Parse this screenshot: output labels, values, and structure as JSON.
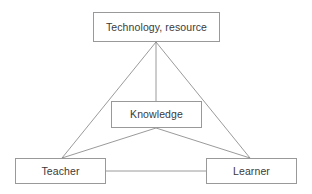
{
  "diagram": {
    "background_color": "#ffffff",
    "node_border_color": "#999999",
    "node_fill_color": "#ffffff",
    "edge_color": "#808080",
    "label_color": "#3a3a3a",
    "nodes": [
      {
        "id": "technology",
        "label": "Technology, resource",
        "x": 93,
        "y": 12,
        "width": 127,
        "height": 30
      },
      {
        "id": "knowledge",
        "label": "Knowledge",
        "x": 111,
        "y": 101,
        "width": 91,
        "height": 27
      },
      {
        "id": "teacher",
        "label": "Teacher",
        "x": 15,
        "y": 158,
        "width": 91,
        "height": 26
      },
      {
        "id": "learner",
        "label": "Learner",
        "x": 206,
        "y": 158,
        "width": 91,
        "height": 26
      }
    ],
    "edges": [
      {
        "id": "technology-teacher",
        "from": "technology",
        "to": "teacher",
        "x1": 156,
        "y1": 42,
        "x2": 62,
        "y2": 158
      },
      {
        "id": "technology-knowledge",
        "from": "technology",
        "to": "knowledge",
        "x1": 156,
        "y1": 42,
        "x2": 156,
        "y2": 101
      },
      {
        "id": "technology-learner",
        "from": "technology",
        "to": "learner",
        "x1": 156,
        "y1": 42,
        "x2": 250,
        "y2": 158
      },
      {
        "id": "knowledge-teacher",
        "from": "knowledge",
        "to": "teacher",
        "x1": 156,
        "y1": 128,
        "x2": 62,
        "y2": 158
      },
      {
        "id": "knowledge-learner",
        "from": "knowledge",
        "to": "learner",
        "x1": 156,
        "y1": 128,
        "x2": 250,
        "y2": 158
      },
      {
        "id": "teacher-learner",
        "from": "teacher",
        "to": "learner",
        "x1": 106,
        "y1": 171,
        "x2": 206,
        "y2": 171
      }
    ]
  }
}
